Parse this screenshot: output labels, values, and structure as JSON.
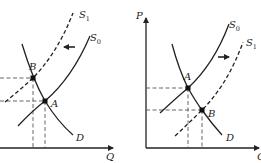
{
  "panels": [
    {
      "id": "left",
      "axes": {
        "x_label": "Q",
        "y_label": ""
      },
      "curves": {
        "demand": "D",
        "supply_original": "S",
        "supply_original_sub": "0",
        "supply_shifted": "S",
        "supply_shifted_sub": "1"
      },
      "points": {
        "first": "A",
        "second": "B"
      },
      "shift_direction": "left"
    },
    {
      "id": "right",
      "axes": {
        "x_label": "Q",
        "y_label": "P"
      },
      "curves": {
        "demand": "D",
        "supply_original": "S",
        "supply_original_sub": "0",
        "supply_shifted": "S",
        "supply_shifted_sub": "1"
      },
      "points": {
        "first": "A",
        "second": "B"
      },
      "shift_direction": "right"
    }
  ],
  "colors": {
    "ink": "#222222",
    "background": "#ffffff"
  }
}
